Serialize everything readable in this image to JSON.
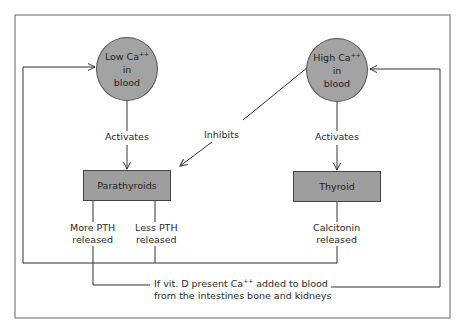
{
  "diagram": {
    "colors": {
      "node_fill": "#a3a3a3",
      "box_fill": "#9e9e9e",
      "line": "#333333",
      "frame": "#666666",
      "background": "#ffffff"
    },
    "nodes": {
      "low_ca": {
        "line1_prefix": "Low Ca",
        "line1_sup": "++",
        "line2": "in",
        "line3": "blood"
      },
      "high_ca": {
        "line1_prefix": "High Ca",
        "line1_sup": "++",
        "line2": "in",
        "line3": "blood"
      },
      "parathyroids": {
        "label": "Parathyroids"
      },
      "thyroid": {
        "label": "Thyroid"
      }
    },
    "edges": {
      "low_activates": "Activates",
      "high_activates": "Activates",
      "high_inhibits": "Inhibits",
      "more_pth": {
        "line1": "More PTH",
        "line2": "released"
      },
      "less_pth": {
        "line1": "Less PTH",
        "line2": "released"
      },
      "calcitonin": {
        "line1": "Calcitonin",
        "line2": "released"
      }
    },
    "footnote": {
      "line1_prefix": "If vit. D present Ca",
      "line1_sup": "++",
      "line1_suffix": " added to blood",
      "line2": "from the intestines bone and kidneys"
    }
  }
}
